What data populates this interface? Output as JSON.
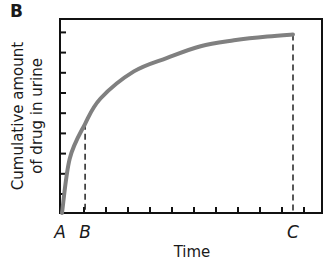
{
  "figure": {
    "panel_label": "B"
  },
  "chart_data": {
    "type": "line",
    "title": "",
    "xlabel": "Time",
    "ylabel": "Cumulative amount of drug in urine",
    "ylabel_lines": [
      "Cumulative amount",
      "of drug in urine"
    ],
    "x_tick_labels": [],
    "y_tick_labels": [],
    "x_tick_count": 11,
    "y_tick_count": 9,
    "grid": false,
    "legend": null,
    "xlim": [
      0,
      1
    ],
    "ylim": [
      0,
      1
    ],
    "markers": [
      {
        "label": "A",
        "x": 0.0,
        "dashed_line": false
      },
      {
        "label": "B",
        "x": 0.09,
        "dashed_line": true,
        "y_at_line": 0.46
      },
      {
        "label": "C",
        "x": 0.9,
        "dashed_line": true,
        "y_at_line": 0.92
      }
    ],
    "series": [
      {
        "name": "Cumulative amount of drug in urine",
        "color": "#808080",
        "x": [
          0.0,
          0.03,
          0.09,
          0.15,
          0.28,
          0.41,
          0.54,
          0.67,
          0.8,
          0.9
        ],
        "y": [
          0.0,
          0.28,
          0.46,
          0.59,
          0.73,
          0.8,
          0.86,
          0.89,
          0.91,
          0.92
        ]
      }
    ]
  },
  "colors": {
    "curve": "#808080",
    "axis": "#111111",
    "background": "#ffffff"
  }
}
